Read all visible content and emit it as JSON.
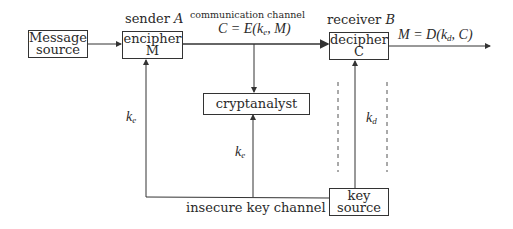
{
  "diagram": {
    "nodes": {
      "message_source": {
        "line1": "Message",
        "line2": "source"
      },
      "encipher": {
        "header": "sender",
        "header_var": "A",
        "line1": "encipher",
        "line2": "M"
      },
      "decipher": {
        "header": "receiver",
        "header_var": "B",
        "line1": "decipher",
        "line2": "C"
      },
      "cryptanalyst": {
        "label": "cryptanalyst"
      },
      "key_source": {
        "line1": "key",
        "line2": "source"
      }
    },
    "edges": {
      "channel_caption": "communication channel",
      "channel_formula": {
        "lhs": "C = E(k",
        "sub": "e",
        "rhs": ", M)"
      },
      "output_formula": {
        "lhs": "M = D(k",
        "sub": "d",
        "rhs": ", C)"
      },
      "ke_left": {
        "base": "k",
        "sub": "e"
      },
      "ke_center": {
        "base": "k",
        "sub": "e"
      },
      "kd_right": {
        "base": "k",
        "sub": "d"
      },
      "insecure_key_channel": "insecure key channel"
    },
    "colors": {
      "line": "#333333",
      "text": "#2a2a2a",
      "background": "#ffffff"
    }
  }
}
